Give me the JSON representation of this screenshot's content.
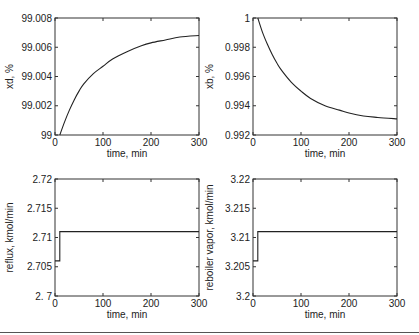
{
  "chart_data": [
    {
      "type": "line",
      "id": "xd",
      "title": "",
      "xlabel": "time, min",
      "ylabel": "xd, %",
      "xlim": [
        0,
        300
      ],
      "ylim": [
        99,
        99.008
      ],
      "xticks": [
        0,
        100,
        200,
        300
      ],
      "xtick_labels": [
        "0",
        "100",
        "200",
        "300"
      ],
      "yticks": [
        99,
        99.002,
        99.004,
        99.006,
        99.008
      ],
      "ytick_labels": [
        "99",
        "99.002",
        "99.004",
        "99.006",
        "99.008"
      ],
      "grid": false,
      "x": [
        10,
        20,
        30,
        40,
        50,
        60,
        80,
        100,
        120,
        150,
        180,
        200,
        230,
        260,
        300
      ],
      "y": [
        99.0,
        99.0009,
        99.0017,
        99.0024,
        99.003,
        99.0035,
        99.0042,
        99.0047,
        99.0052,
        99.0057,
        99.0061,
        99.0063,
        99.0065,
        99.0067,
        99.0068
      ]
    },
    {
      "type": "line",
      "id": "xb",
      "title": "",
      "xlabel": "time, min",
      "ylabel": "xb, %",
      "xlim": [
        0,
        300
      ],
      "ylim": [
        0.992,
        1.0
      ],
      "xticks": [
        0,
        100,
        200,
        300
      ],
      "xtick_labels": [
        "0",
        "100",
        "200",
        "300"
      ],
      "yticks": [
        0.992,
        0.994,
        0.996,
        0.998,
        1.0
      ],
      "ytick_labels": [
        "0.992",
        "0.994",
        "0.996",
        "0.998",
        "1"
      ],
      "grid": false,
      "x": [
        10,
        20,
        30,
        40,
        50,
        60,
        80,
        100,
        120,
        150,
        180,
        200,
        230,
        260,
        300
      ],
      "y": [
        1.0,
        0.999,
        0.9982,
        0.9975,
        0.9969,
        0.9964,
        0.9956,
        0.995,
        0.9945,
        0.994,
        0.9937,
        0.9935,
        0.9933,
        0.9932,
        0.9931
      ]
    },
    {
      "type": "line",
      "id": "reflux",
      "title": "",
      "xlabel": "time, min",
      "ylabel": "reflux, kmol/min",
      "xlim": [
        0,
        300
      ],
      "ylim": [
        2.7,
        2.72
      ],
      "xticks": [
        0,
        100,
        200,
        300
      ],
      "xtick_labels": [
        "0",
        "100",
        "200",
        "300"
      ],
      "yticks": [
        2.7,
        2.705,
        2.71,
        2.715,
        2.72
      ],
      "ytick_labels": [
        "2. 7",
        "2.705",
        "2.71",
        "2.715",
        "2.72"
      ],
      "grid": false,
      "x": [
        0,
        10,
        10,
        300
      ],
      "y": [
        2.706,
        2.706,
        2.711,
        2.711
      ]
    },
    {
      "type": "line",
      "id": "reboiler",
      "title": "",
      "xlabel": "time, min",
      "ylabel": "reboiler vapor, kmol/min",
      "xlim": [
        0,
        300
      ],
      "ylim": [
        3.2,
        3.22
      ],
      "xticks": [
        0,
        100,
        200,
        300
      ],
      "xtick_labels": [
        "0",
        "100",
        "200",
        "300"
      ],
      "yticks": [
        3.2,
        3.205,
        3.21,
        3.215,
        3.22
      ],
      "ytick_labels": [
        "3.2",
        "3.205",
        "3.21",
        "3.215",
        "3.22"
      ],
      "grid": false,
      "x": [
        0,
        10,
        10,
        300
      ],
      "y": [
        3.206,
        3.206,
        3.211,
        3.211
      ]
    }
  ],
  "layout": {
    "panels": [
      {
        "left": 55,
        "top": 18,
        "width": 144,
        "height": 117
      },
      {
        "left": 253,
        "top": 18,
        "width": 144,
        "height": 117
      },
      {
        "left": 55,
        "top": 179,
        "width": 144,
        "height": 117
      },
      {
        "left": 253,
        "top": 179,
        "width": 144,
        "height": 117
      }
    ]
  }
}
